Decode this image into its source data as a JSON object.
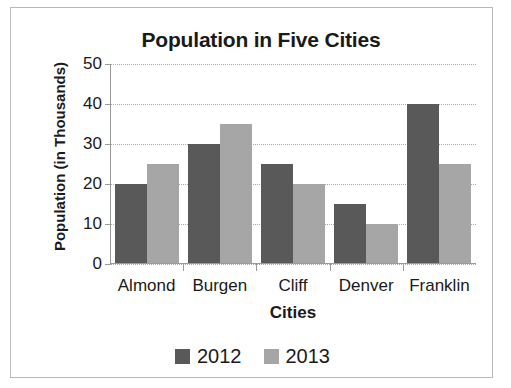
{
  "chart_data": {
    "type": "bar",
    "title": "Population in Five Cities",
    "xlabel": "Cities",
    "ylabel": "Population (in Thousands)",
    "categories": [
      "Almond",
      "Burgen",
      "Cliff",
      "Denver",
      "Franklin"
    ],
    "series": [
      {
        "name": "2012",
        "color": "#595959",
        "values": [
          20,
          30,
          25,
          15,
          40
        ]
      },
      {
        "name": "2013",
        "color": "#a6a6a6",
        "values": [
          25,
          35,
          20,
          10,
          25
        ]
      }
    ],
    "yticks": [
      0,
      10,
      20,
      30,
      40,
      50
    ],
    "ylim": [
      0,
      50
    ],
    "grid": true,
    "legend_position": "bottom"
  },
  "legend": {
    "items": [
      {
        "label": "2012",
        "swatch": "dark-gray-swatch"
      },
      {
        "label": "2013",
        "swatch": "light-gray-swatch"
      }
    ]
  }
}
